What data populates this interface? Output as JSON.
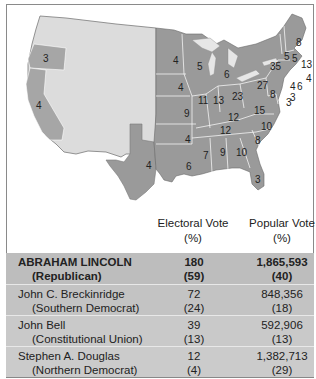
{
  "map": {
    "title": "",
    "colors": {
      "republican_states": "#9a9a9a",
      "territories": "#dcdcdc",
      "border": "#ffffff",
      "coast": "#7a7a7a"
    },
    "state_labels": [
      {
        "state": "Oregon",
        "votes": "3"
      },
      {
        "state": "California",
        "votes": "4"
      },
      {
        "state": "Texas",
        "votes": "4"
      },
      {
        "state": "Minnesota",
        "votes": "4"
      },
      {
        "state": "Wisconsin",
        "votes": "5"
      },
      {
        "state": "Michigan",
        "votes": "6"
      },
      {
        "state": "Iowa",
        "votes": "4"
      },
      {
        "state": "Illinois",
        "votes": "11"
      },
      {
        "state": "Indiana",
        "votes": "13"
      },
      {
        "state": "Ohio",
        "votes": "23"
      },
      {
        "state": "Pennsylvania",
        "votes": "27"
      },
      {
        "state": "New York",
        "votes": "35"
      },
      {
        "state": "Maine",
        "votes": "8"
      },
      {
        "state": "New Hampshire",
        "votes": "5"
      },
      {
        "state": "Vermont",
        "votes": "5"
      },
      {
        "state": "Massachusetts",
        "votes": "13"
      },
      {
        "state": "Rhode Island",
        "votes": "4"
      },
      {
        "state": "Connecticut",
        "votes": "6"
      },
      {
        "state": "New Jersey",
        "votes": "4"
      },
      {
        "state": "Delaware",
        "votes": "3"
      },
      {
        "state": "Maryland",
        "votes": "8"
      },
      {
        "state": "Missouri",
        "votes": "9"
      },
      {
        "state": "Kentucky",
        "votes": "12"
      },
      {
        "state": "Virginia",
        "votes": "15"
      },
      {
        "state": "Tennessee",
        "votes": "12"
      },
      {
        "state": "North Carolina",
        "votes": "10"
      },
      {
        "state": "Arkansas",
        "votes": "4"
      },
      {
        "state": "South Carolina",
        "votes": "8"
      },
      {
        "state": "Mississippi",
        "votes": "7"
      },
      {
        "state": "Alabama",
        "votes": "9"
      },
      {
        "state": "Georgia",
        "votes": "10"
      },
      {
        "state": "Louisiana",
        "votes": "6"
      },
      {
        "state": "Florida",
        "votes": "3"
      },
      {
        "state": "District",
        "votes": "3"
      }
    ]
  },
  "table": {
    "headers": {
      "electoral_line1": "Electoral Vote",
      "electoral_line2": "(%)",
      "popular_line1": "Popular Vote",
      "popular_line2": "(%)"
    },
    "rows": [
      {
        "candidate": "ABRAHAM LINCOLN",
        "party": "(Republican)",
        "electoral": "180",
        "electoral_pct": "(59)",
        "popular": "1,865,593",
        "popular_pct": "(40)"
      },
      {
        "candidate": "John C. Breckinridge",
        "party": "(Southern Democrat)",
        "electoral": "72",
        "electoral_pct": "(24)",
        "popular": "848,356",
        "popular_pct": "(18)"
      },
      {
        "candidate": "John Bell",
        "party": "(Constitutional Union)",
        "electoral": "39",
        "electoral_pct": "(13)",
        "popular": "592,906",
        "popular_pct": "(13)"
      },
      {
        "candidate": "Stephen A. Douglas",
        "party": "(Northern Democrat)",
        "electoral": "12",
        "electoral_pct": "(4)",
        "popular": "1,382,713",
        "popular_pct": "(29)"
      }
    ]
  }
}
